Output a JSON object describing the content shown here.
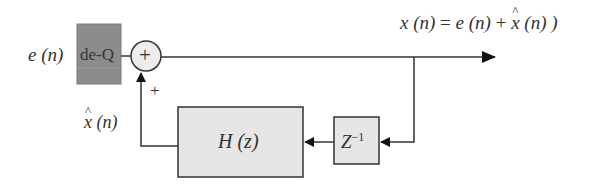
{
  "diagram": {
    "input_label": "e (n)",
    "dequantizer_label": "de-Q",
    "adder_symbol": "+",
    "feedback_sign": "+",
    "output_label_lhs": "x (n)",
    "output_label_eq": "=",
    "output_label_e": "e (n)",
    "output_label_plus": "+",
    "output_label_xhat": "x",
    "output_label_xhat_arg": "(n) )",
    "prediction_label_var": "x",
    "prediction_label_arg": "(n)",
    "filter_label": "H (z)",
    "delay_label_base": "Z",
    "delay_label_exp": "−1"
  },
  "colors": {
    "dequantizer_fill": "#8c8c8c",
    "block_fill": "#e6e6e6",
    "line": "#333333"
  }
}
